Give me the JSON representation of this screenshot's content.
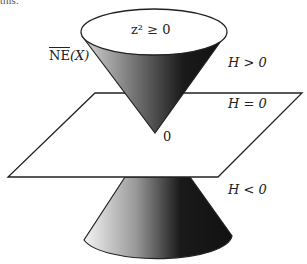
{
  "fragment_text": "this.",
  "labels": {
    "cone_top": "z² ≥ 0",
    "ne_x_main": "NE",
    "ne_x_arg": "(X)",
    "h_pos": "H > 0",
    "h_zero": "H = 0",
    "origin": "0",
    "h_neg": "H < 0"
  },
  "colors": {
    "line": "#222222",
    "cone_dark": "#111111",
    "cone_light": "#f2f2f2",
    "background": "#ffffff"
  }
}
